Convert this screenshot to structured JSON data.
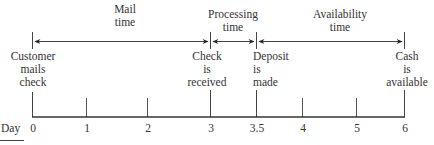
{
  "diagram": {
    "type": "timeline",
    "axis_label": "Day",
    "periods": [
      {
        "label_line1": "Mail",
        "label_line2": "time",
        "from_day": 0,
        "to_day": 3
      },
      {
        "label_line1": "Processing",
        "label_line2": "time",
        "from_day": 3,
        "to_day": 3.5
      },
      {
        "label_line1": "Availability",
        "label_line2": "time",
        "from_day": 3.5,
        "to_day": 6
      }
    ],
    "events": [
      {
        "day": 0,
        "lines": [
          "Customer",
          "mails",
          "check"
        ]
      },
      {
        "day": 3,
        "lines": [
          "Check",
          "is",
          "received"
        ]
      },
      {
        "day": 3.5,
        "lines": [
          "Deposit",
          "is",
          "made"
        ]
      },
      {
        "day": 6,
        "lines": [
          "Cash",
          "is",
          "available"
        ]
      }
    ],
    "ticks": [
      "0",
      "1",
      "2",
      "3",
      "3.5",
      "4",
      "5",
      "6"
    ]
  }
}
